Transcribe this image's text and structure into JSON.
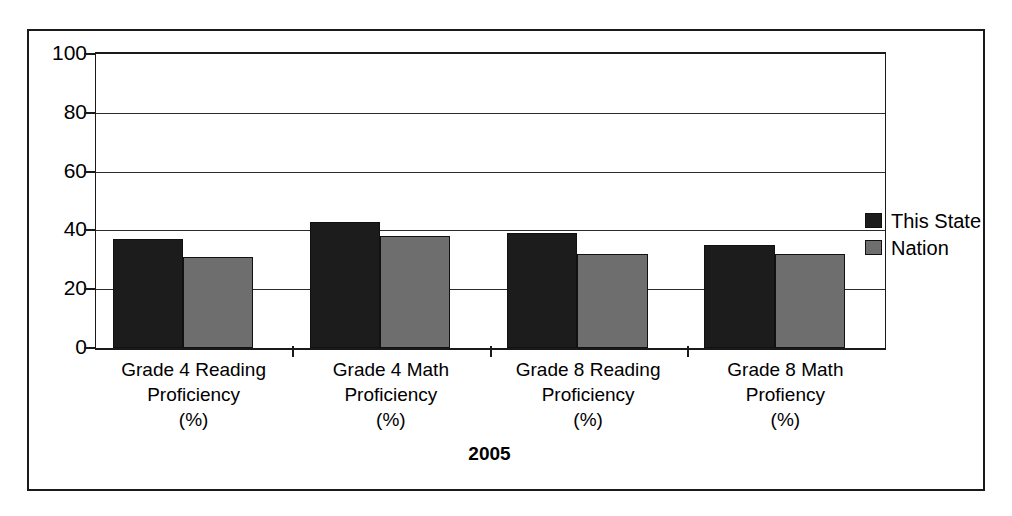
{
  "chart_data": {
    "type": "bar",
    "title": "",
    "xlabel": "2005",
    "ylabel": "",
    "ylim": [
      0,
      100
    ],
    "yticks": [
      0,
      20,
      40,
      60,
      80,
      100
    ],
    "grid": true,
    "legend_position": "right",
    "categories": [
      "Grade 4 Reading Proficiency (%)",
      "Grade 4 Math Proficiency (%)",
      "Grade 8 Reading Proficiency (%)",
      "Grade 8 Math Profiency (%)"
    ],
    "category_lines": [
      [
        "Grade 4 Reading",
        "Proficiency",
        "(%)"
      ],
      [
        "Grade 4 Math",
        "Proficiency",
        "(%)"
      ],
      [
        "Grade 8 Reading",
        "Proficiency",
        "(%)"
      ],
      [
        "Grade 8 Math",
        "Profiency",
        "(%)"
      ]
    ],
    "series": [
      {
        "name": "This State",
        "color": "#1c1c1c",
        "values": [
          37,
          43,
          39,
          35
        ]
      },
      {
        "name": "Nation",
        "color": "#6e6e6e",
        "values": [
          31,
          38,
          32,
          32
        ]
      }
    ]
  },
  "legend": {
    "items": [
      {
        "label": "This State",
        "swatch": "black-square-swatch"
      },
      {
        "label": "Nation",
        "swatch": "gray-square-swatch"
      }
    ]
  },
  "axis": {
    "y_tick_labels": [
      "100",
      "80",
      "60",
      "40",
      "20",
      "0"
    ],
    "x_axis_title": "2005"
  },
  "colors": {
    "series_this_state": "#1c1c1c",
    "series_nation": "#6e6e6e",
    "frame": "#1a1a1a",
    "background": "#ffffff"
  }
}
